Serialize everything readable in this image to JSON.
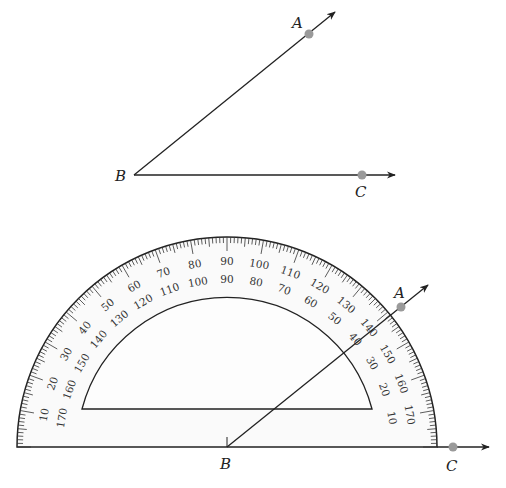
{
  "figure": {
    "type": "angle-measurement-with-protractor",
    "colors": {
      "line": "#222222",
      "point": "#9a9a9a",
      "protractor_fill": "#fafafa"
    }
  },
  "top_angle": {
    "vertex": {
      "label": "B",
      "x": 134,
      "y": 175
    },
    "ray_ba": {
      "point_label": "A",
      "point": [
        309,
        34
      ],
      "arrow_tip": [
        335,
        12
      ]
    },
    "ray_bc": {
      "point_label": "C",
      "point": [
        362,
        175
      ],
      "arrow_tip": [
        395,
        175
      ]
    }
  },
  "protractor": {
    "center": [
      227,
      447
    ],
    "outer_radius": 210,
    "inner_radius": 150,
    "window_baseline_y": 409,
    "outer_scale_labels": [
      "10",
      "20",
      "30",
      "40",
      "50",
      "60",
      "70",
      "80",
      "90",
      "100",
      "110",
      "120",
      "130",
      "140",
      "150",
      "160",
      "170"
    ],
    "inner_scale_labels": [
      "170",
      "160",
      "150",
      "140",
      "130",
      "120",
      "110",
      "100",
      "90",
      "80",
      "70",
      "60",
      "50",
      "40",
      "30",
      "20",
      "10"
    ],
    "vertex": {
      "label": "B"
    },
    "ray_ba": {
      "point_label": "A",
      "point": [
        401,
        307
      ],
      "arrow_tip": [
        428,
        285
      ]
    },
    "ray_bc": {
      "point_label": "C",
      "point": [
        453,
        447
      ],
      "arrow_tip": [
        489,
        447
      ]
    },
    "measured_angle_degrees": 40
  }
}
